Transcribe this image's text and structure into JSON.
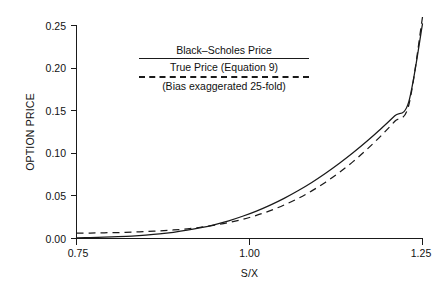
{
  "chart_data": {
    "type": "line",
    "title": "",
    "xlabel": "S/X",
    "ylabel": "OPTION PRICE",
    "xlim": [
      0.75,
      1.25
    ],
    "ylim": [
      0.0,
      0.26
    ],
    "grid": false,
    "legend_position": "upper-center-left",
    "x_ticks": [
      "0.75",
      "1.00",
      "1.25"
    ],
    "x_tick_values": [
      0.75,
      1.0,
      1.25
    ],
    "y_ticks": [
      "0.00",
      "0.05",
      "0.10",
      "0.15",
      "0.20",
      "0.25"
    ],
    "y_tick_values": [
      0.0,
      0.05,
      0.1,
      0.15,
      0.2,
      0.25
    ],
    "x": [
      0.75,
      0.77,
      0.79,
      0.81,
      0.83,
      0.85,
      0.87,
      0.89,
      0.91,
      0.93,
      0.95,
      0.97,
      0.99,
      1.01,
      1.03,
      1.05,
      1.07,
      1.09,
      1.11,
      1.13,
      1.15,
      1.17,
      1.19,
      1.21,
      1.23,
      1.25
    ],
    "series": [
      {
        "name": "Black-Scholes Price",
        "style": "solid",
        "values": [
          0.0008,
          0.0011,
          0.0015,
          0.0021,
          0.0029,
          0.004,
          0.0054,
          0.0073,
          0.0097,
          0.0127,
          0.0164,
          0.0208,
          0.0261,
          0.0322,
          0.0392,
          0.0471,
          0.056,
          0.0658,
          0.0766,
          0.0883,
          0.1009,
          0.1144,
          0.1288,
          0.144,
          0.16,
          0.252
        ]
      },
      {
        "name": "True Price (Equation 9)",
        "style": "dashed",
        "values": [
          0.0062,
          0.0064,
          0.0067,
          0.007,
          0.0075,
          0.0081,
          0.0089,
          0.01,
          0.0114,
          0.0133,
          0.0157,
          0.0187,
          0.0225,
          0.0271,
          0.0327,
          0.0393,
          0.047,
          0.0559,
          0.0661,
          0.0776,
          0.0905,
          0.1048,
          0.1205,
          0.1376,
          0.1561,
          0.26
        ]
      }
    ]
  },
  "legend": {
    "line1": "Black–Scholes Price",
    "line2": "True Price (Equation 9)",
    "line3": "(Bias exaggerated 25-fold)"
  },
  "axes": {
    "y_title": "OPTION PRICE",
    "x_title": "S/X"
  }
}
